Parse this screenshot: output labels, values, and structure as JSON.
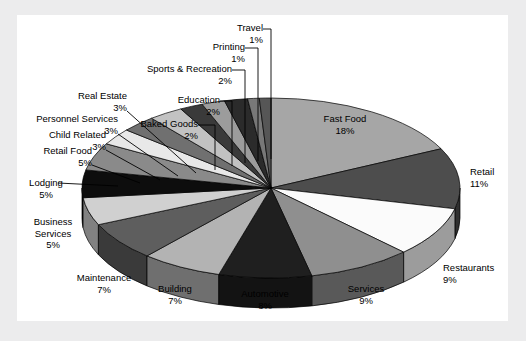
{
  "chart_data": {
    "type": "pie",
    "title": "",
    "subtitle": "",
    "xlabel": "",
    "ylabel": "",
    "legend_position": "none",
    "grid": false,
    "value_unit": "%",
    "three_d": true,
    "categories": [
      "Fast Food",
      "Retail",
      "Restaurants",
      "Services",
      "Automotive",
      "Building",
      "Maintenance",
      "Business Services",
      "Lodging",
      "Retail Food",
      "Child Related",
      "Personnel Services",
      "Real Estate",
      "Baked Goods",
      "Education",
      "Sports & Recreation",
      "Printing",
      "Travel"
    ],
    "values": [
      18,
      11,
      9,
      9,
      8,
      7,
      7,
      5,
      5,
      5,
      3,
      3,
      3,
      2,
      2,
      2,
      1,
      1
    ],
    "slices": [
      {
        "label": "Fast Food",
        "percent": 18,
        "percent_text": "18%",
        "color": "#a6a6a6"
      },
      {
        "label": "Retail",
        "percent": 11,
        "percent_text": "11%",
        "color": "#4d4d4d"
      },
      {
        "label": "Restaurants",
        "percent": 9,
        "percent_text": "9%",
        "color": "#fbfbfb"
      },
      {
        "label": "Services",
        "percent": 9,
        "percent_text": "9%",
        "color": "#8f8f8f"
      },
      {
        "label": "Automotive",
        "percent": 8,
        "percent_text": "8%",
        "color": "#1f1f1f"
      },
      {
        "label": "Building",
        "percent": 7,
        "percent_text": "7%",
        "color": "#b3b3b3"
      },
      {
        "label": "Maintenance",
        "percent": 7,
        "percent_text": "7%",
        "color": "#5e5e5e"
      },
      {
        "label": "Business Services",
        "percent": 5,
        "percent_text": "5%",
        "color": "#d0d0d0"
      },
      {
        "label": "Lodging",
        "percent": 5,
        "percent_text": "5%",
        "color": "#0d0d0d"
      },
      {
        "label": "Retail Food",
        "percent": 5,
        "percent_text": "5%",
        "color": "#8a8a8a"
      },
      {
        "label": "Child Related",
        "percent": 3,
        "percent_text": "3%",
        "color": "#e8e8e8"
      },
      {
        "label": "Personnel Services",
        "percent": 3,
        "percent_text": "3%",
        "color": "#707070"
      },
      {
        "label": "Real Estate",
        "percent": 3,
        "percent_text": "3%",
        "color": "#c2c2c2"
      },
      {
        "label": "Baked Goods",
        "percent": 2,
        "percent_text": "2%",
        "color": "#3a3a3a"
      },
      {
        "label": "Education",
        "percent": 2,
        "percent_text": "2%",
        "color": "#9c9c9c"
      },
      {
        "label": "Sports & Recreation",
        "percent": 2,
        "percent_text": "2%",
        "color": "#2b2b2b"
      },
      {
        "label": "Printing",
        "percent": 1,
        "percent_text": "1%",
        "color": "#787878"
      },
      {
        "label": "Travel",
        "percent": 1,
        "percent_text": "1%",
        "color": "#565656"
      }
    ]
  },
  "labels": {
    "fast_food": {
      "name": "Fast Food",
      "pct": "18%"
    },
    "retail": {
      "name": "Retail",
      "pct": "11%"
    },
    "restaurants": {
      "name": "Restaurants",
      "pct": "9%"
    },
    "services": {
      "name": "Services",
      "pct": "9%"
    },
    "automotive": {
      "name": "Automotive",
      "pct": "8%"
    },
    "building": {
      "name": "Building",
      "pct": "7%"
    },
    "maintenance": {
      "name": "Maintenance",
      "pct": "7%"
    },
    "business_services": {
      "name": "Business\nServices",
      "pct": "5%"
    },
    "business_services_l1": "Business",
    "business_services_l2": "Services",
    "lodging": {
      "name": "Lodging",
      "pct": "5%"
    },
    "retail_food": {
      "name": "Retail Food",
      "pct": "5%"
    },
    "child_related": {
      "name": "Child Related",
      "pct": "3%"
    },
    "personnel_services": {
      "name": "Personnel Services",
      "pct": "3%"
    },
    "real_estate": {
      "name": "Real Estate",
      "pct": "3%"
    },
    "baked_goods": {
      "name": "Baked Goods",
      "pct": "2%"
    },
    "education": {
      "name": "Education",
      "pct": "2%"
    },
    "sports_recreation": {
      "name": "Sports & Recreation",
      "pct": "2%"
    },
    "printing": {
      "name": "Printing",
      "pct": "1%"
    },
    "travel": {
      "name": "Travel",
      "pct": "1%"
    }
  },
  "colors": {
    "page_background": "#ececed",
    "panel_background": "#ffffff",
    "text": "#000000",
    "leader_line": "#000000",
    "slice_edge": "#000000"
  }
}
